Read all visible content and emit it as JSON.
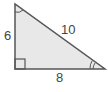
{
  "diagram": {
    "type": "right-triangle",
    "sides": {
      "left_leg": "6",
      "hypotenuse": "10",
      "bottom_leg": "8"
    },
    "markers": {
      "right_angle": "bottom-left",
      "single_arc_angle": "top",
      "double_arc_angle": "bottom-right"
    },
    "colors": {
      "fill": "#e8e8e8",
      "stroke": "#555555",
      "text": "#444444"
    }
  }
}
